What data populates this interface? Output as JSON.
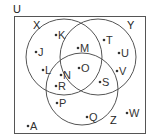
{
  "diagram": {
    "type": "venn",
    "universe_label": "U",
    "stroke_color": "#555555",
    "sets": [
      {
        "name": "X",
        "label": "X"
      },
      {
        "name": "Y",
        "label": "Y"
      },
      {
        "name": "Z",
        "label": "Z"
      }
    ],
    "regions": {
      "X_only": [
        "K",
        "J",
        "L"
      ],
      "Y_only": [
        "T",
        "U",
        "V"
      ],
      "Z_only": [
        "P",
        "Q"
      ],
      "X_and_Y_only": [
        "M"
      ],
      "X_and_Z_only": [
        "N",
        "R"
      ],
      "Y_and_Z_only": [
        "S"
      ],
      "X_and_Y_and_Z": [
        "O"
      ],
      "outside_all": [
        "A",
        "W"
      ]
    },
    "elements": [
      {
        "label": "K",
        "x": 57,
        "y": 35
      },
      {
        "label": "J",
        "x": 37,
        "y": 53
      },
      {
        "label": "L",
        "x": 44,
        "y": 70
      },
      {
        "label": "M",
        "x": 79,
        "y": 48
      },
      {
        "label": "T",
        "x": 106,
        "y": 40
      },
      {
        "label": "U",
        "x": 120,
        "y": 53
      },
      {
        "label": "V",
        "x": 118,
        "y": 71
      },
      {
        "label": "N",
        "x": 61,
        "y": 75
      },
      {
        "label": "O",
        "x": 80,
        "y": 69
      },
      {
        "label": "R",
        "x": 57,
        "y": 86
      },
      {
        "label": "S",
        "x": 101,
        "y": 82
      },
      {
        "label": "P",
        "x": 58,
        "y": 103
      },
      {
        "label": "Q",
        "x": 87,
        "y": 117
      },
      {
        "label": "W",
        "x": 128,
        "y": 113
      },
      {
        "label": "A",
        "x": 28,
        "y": 126
      }
    ]
  }
}
